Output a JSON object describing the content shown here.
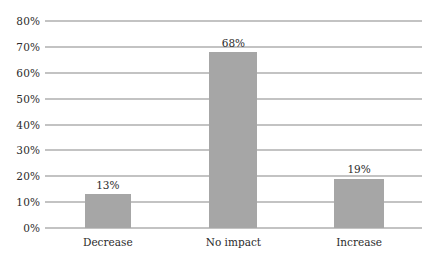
{
  "chart_data": {
    "type": "bar",
    "title": "",
    "subtitle": "",
    "xlabel": "",
    "ylabel": "",
    "categories": [
      "Decrease",
      "No impact",
      "Increase"
    ],
    "values": [
      13,
      68,
      19
    ],
    "value_labels": [
      "13%",
      "68%",
      "19%"
    ],
    "ylim": [
      0,
      80
    ],
    "ytick_values": [
      0,
      10,
      20,
      30,
      40,
      50,
      60,
      70,
      80
    ],
    "ytick_labels": [
      "0%",
      "10%",
      "20%",
      "30%",
      "40%",
      "50%",
      "60%",
      "70%",
      "80%"
    ],
    "grid": "horizontal",
    "legend": "none",
    "series": [
      {
        "name": "",
        "values": [
          13,
          68,
          19
        ],
        "color": "#a6a6a6"
      }
    ],
    "annotations": []
  },
  "style": {
    "background_color": "#ffffff",
    "bar_color": "#a6a6a6",
    "gridline_color": "#888888",
    "text_color": "#2b2b2b"
  }
}
